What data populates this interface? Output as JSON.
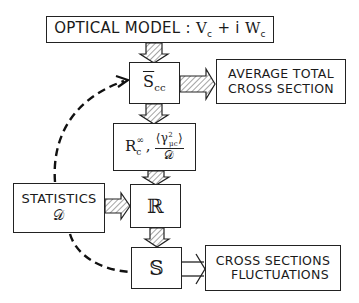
{
  "diagram": {
    "nodes": {
      "optical_model": {
        "label": "OPTICAL MODEL : ",
        "v": "V",
        "sub": "c",
        "plus": " + i ",
        "w": "W",
        "wsub": "c"
      },
      "s_cc": {
        "main": "S",
        "sub": "cc"
      },
      "average": {
        "line1": "AVERAGE TOTAL",
        "line2": "CROSS SECTION"
      },
      "r_params": {
        "r": "R",
        "r_sup": "∞",
        "r_sub": "c",
        "comma": ",",
        "num_open": "⟨",
        "gamma": "γ",
        "gamma_sup": "2",
        "gamma_sub": "μc",
        "num_close": "⟩",
        "den": "𝒟"
      },
      "statistics": {
        "line1": "STATISTICS",
        "line2": "𝒟"
      },
      "r_matrix": {
        "label": "ℝ"
      },
      "s_matrix": {
        "label": "𝕊"
      },
      "fluct": {
        "line1": "CROSS SECTIONS",
        "line2": "FLUCTUATIONS"
      }
    },
    "colors": {
      "stroke": "#222222",
      "hatch": "#555555",
      "background": "#ffffff"
    }
  }
}
